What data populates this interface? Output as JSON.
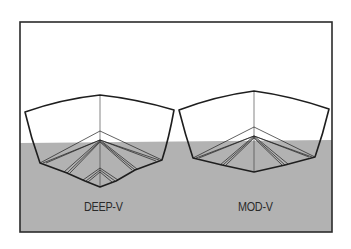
{
  "figure": {
    "colors": {
      "water": "#b2b2b2",
      "sky": "#ffffff",
      "frame": "#2b2b2b",
      "hull_line": "#1e1e1e",
      "label_text": "#2a2a2a"
    },
    "hulls": [
      {
        "id": "deep-v",
        "label": "DEEP-V"
      },
      {
        "id": "mod-v",
        "label": "MOD-V"
      }
    ]
  }
}
